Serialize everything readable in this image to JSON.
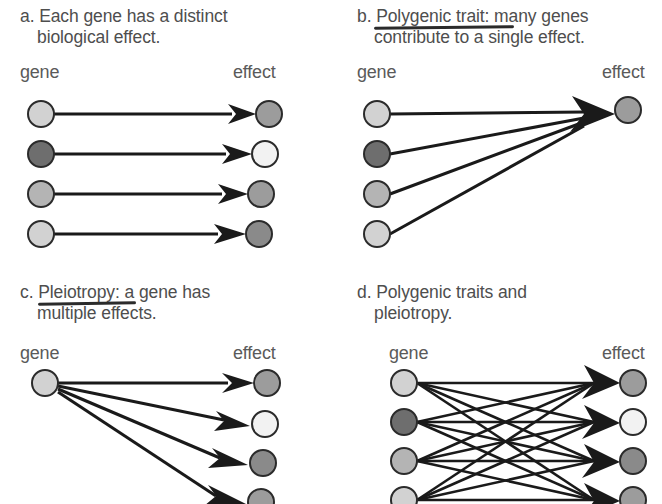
{
  "figure": {
    "background_color": "#ffffff",
    "width": 662,
    "height": 504
  },
  "palette": {
    "line": "#1a1a1a",
    "circle_stroke": "#2b2b2b",
    "text": "#4e4e4e",
    "label": "#5a5a5a",
    "light_gray": "#d2d2d2",
    "pale": "#f2f2f2",
    "mid_gray": "#a8a8a8",
    "dark_gray": "#6e6e6e",
    "effect_gray": "#9c9c9c",
    "underline": "#2b2b2b"
  },
  "column_labels": {
    "gene": "gene",
    "effect": "effect"
  },
  "panels": [
    {
      "id": "a",
      "letter": "a.",
      "caption_line1": "a. Each gene has a distinct",
      "caption_line2": "biological effect.",
      "term": "",
      "term_underlined": false,
      "mapping": "one-to-one",
      "gene_count": 4,
      "effect_count": 4,
      "gene_colors": [
        "#d2d2d2",
        "#6e6e6e",
        "#b4b4b4",
        "#d2d2d2"
      ],
      "effect_colors": [
        "#9c9c9c",
        "#f2f2f2",
        "#9c9c9c",
        "#8a8a8a"
      ],
      "edges": [
        [
          0,
          0
        ],
        [
          1,
          1
        ],
        [
          2,
          2
        ],
        [
          3,
          3
        ]
      ]
    },
    {
      "id": "b",
      "letter": "b.",
      "caption_line1": "b. Polygenic trait: many genes",
      "caption_line2": "contribute to a single effect.",
      "term": "Polygenic trait:",
      "term_underlined": true,
      "mapping": "many-to-one",
      "gene_count": 4,
      "effect_count": 1,
      "gene_colors": [
        "#d2d2d2",
        "#6e6e6e",
        "#b4b4b4",
        "#d2d2d2"
      ],
      "effect_colors": [
        "#9c9c9c"
      ],
      "edges": [
        [
          0,
          0
        ],
        [
          1,
          0
        ],
        [
          2,
          0
        ],
        [
          3,
          0
        ]
      ]
    },
    {
      "id": "c",
      "letter": "c.",
      "caption_line1": "c. Pleiotropy: a gene has",
      "caption_line2": "multiple effects.",
      "term": "Pleiotropy:",
      "term_underlined": true,
      "mapping": "one-to-many",
      "gene_count": 1,
      "effect_count": 4,
      "gene_colors": [
        "#d2d2d2"
      ],
      "effect_colors": [
        "#9c9c9c",
        "#f2f2f2",
        "#8a8a8a",
        "#9c9c9c"
      ],
      "edges": [
        [
          0,
          0
        ],
        [
          0,
          1
        ],
        [
          0,
          2
        ],
        [
          0,
          3
        ]
      ]
    },
    {
      "id": "d",
      "letter": "d.",
      "caption_line1": "d. Polygenic traits and",
      "caption_line2": "pleiotropy.",
      "term": "",
      "term_underlined": false,
      "mapping": "many-to-many",
      "gene_count": 4,
      "effect_count": 4,
      "gene_colors": [
        "#d2d2d2",
        "#6e6e6e",
        "#b4b4b4",
        "#d2d2d2"
      ],
      "effect_colors": [
        "#9c9c9c",
        "#f2f2f2",
        "#8a8a8a",
        "#9c9c9c"
      ],
      "edges": [
        [
          0,
          0
        ],
        [
          0,
          1
        ],
        [
          0,
          2
        ],
        [
          0,
          3
        ],
        [
          1,
          0
        ],
        [
          1,
          1
        ],
        [
          1,
          2
        ],
        [
          1,
          3
        ],
        [
          2,
          0
        ],
        [
          2,
          1
        ],
        [
          2,
          2
        ],
        [
          2,
          3
        ],
        [
          3,
          0
        ],
        [
          3,
          1
        ],
        [
          3,
          2
        ],
        [
          3,
          3
        ]
      ]
    }
  ]
}
